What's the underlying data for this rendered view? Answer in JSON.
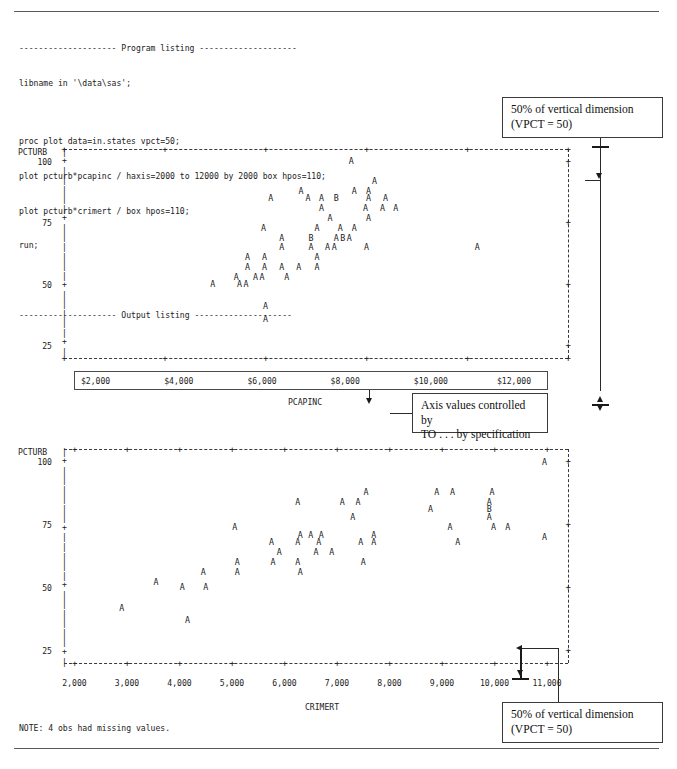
{
  "document": {
    "program_listing_header": "-------------------- Program listing --------------------",
    "output_listing_header": "-------------------- Output listing --------------------",
    "code_lines": [
      "libname in '\\data\\sas';",
      "",
      "proc plot data=in.states vpct=50;",
      "plot pcturb*pcapinc / haxis=2000 to 12000 by 2000 box hpos=110;",
      "plot pcturb*crimert / box hpos=110;",
      "run;"
    ],
    "note": "NOTE: 4 obs had missing values."
  },
  "annotations": [
    {
      "id": "top-right",
      "line1": "50% of vertical dimension",
      "line2": "(VPCT = 50)"
    },
    {
      "id": "middle",
      "line1": "Axis values controlled by",
      "line2": "TO . . . by specification"
    },
    {
      "id": "bottom-right",
      "line1": "50% of vertical dimension",
      "line2": "(VPCT = 50)"
    }
  ],
  "chart_data": [
    {
      "id": "plot-pcapinc",
      "type": "scatter",
      "title": "",
      "xlabel": "PCAPINC",
      "ylabel": "PCTURB",
      "xticklabels": [
        "$2,000",
        "$4,000",
        "$6,000",
        "$8,000",
        "$10,000",
        "$12,000"
      ],
      "xticks": [
        2000,
        4000,
        6000,
        8000,
        10000,
        12000
      ],
      "yticklabels": [
        "100",
        "75",
        "50",
        "25"
      ],
      "yticks": [
        100,
        75,
        50,
        25
      ],
      "xlim": [
        2000,
        12000
      ],
      "ylim": [
        20,
        105
      ],
      "grid": false,
      "box": true,
      "plot_symbol": "A",
      "overlap_symbol": "B",
      "points": [
        {
          "x": 7700,
          "y": 100,
          "s": "A"
        },
        {
          "x": 8160,
          "y": 92,
          "s": "A"
        },
        {
          "x": 6700,
          "y": 88,
          "s": "A"
        },
        {
          "x": 7760,
          "y": 88,
          "s": "A"
        },
        {
          "x": 8040,
          "y": 88,
          "s": "A"
        },
        {
          "x": 6100,
          "y": 85,
          "s": "A"
        },
        {
          "x": 6840,
          "y": 85,
          "s": "A"
        },
        {
          "x": 7110,
          "y": 85,
          "s": "A"
        },
        {
          "x": 7400,
          "y": 85,
          "s": "B"
        },
        {
          "x": 8040,
          "y": 85,
          "s": "A"
        },
        {
          "x": 8380,
          "y": 85,
          "s": "A"
        },
        {
          "x": 7110,
          "y": 81,
          "s": "A"
        },
        {
          "x": 7980,
          "y": 81,
          "s": "A"
        },
        {
          "x": 8320,
          "y": 81,
          "s": "A"
        },
        {
          "x": 8580,
          "y": 81,
          "s": "A"
        },
        {
          "x": 7280,
          "y": 77,
          "s": "A"
        },
        {
          "x": 8040,
          "y": 77,
          "s": "A"
        },
        {
          "x": 5960,
          "y": 73,
          "s": "A"
        },
        {
          "x": 7020,
          "y": 73,
          "s": "A"
        },
        {
          "x": 7480,
          "y": 73,
          "s": "A"
        },
        {
          "x": 7760,
          "y": 73,
          "s": "A"
        },
        {
          "x": 6320,
          "y": 69,
          "s": "A"
        },
        {
          "x": 6900,
          "y": 69,
          "s": "B"
        },
        {
          "x": 7400,
          "y": 69,
          "s": "A"
        },
        {
          "x": 7530,
          "y": 69,
          "s": "B"
        },
        {
          "x": 7660,
          "y": 69,
          "s": "A"
        },
        {
          "x": 6320,
          "y": 65,
          "s": "A"
        },
        {
          "x": 6900,
          "y": 65,
          "s": "A"
        },
        {
          "x": 7230,
          "y": 65,
          "s": "A"
        },
        {
          "x": 7360,
          "y": 65,
          "s": "A"
        },
        {
          "x": 8000,
          "y": 65,
          "s": "A"
        },
        {
          "x": 10200,
          "y": 65,
          "s": "A"
        },
        {
          "x": 5640,
          "y": 61,
          "s": "A"
        },
        {
          "x": 5980,
          "y": 61,
          "s": "A"
        },
        {
          "x": 7020,
          "y": 61,
          "s": "A"
        },
        {
          "x": 5640,
          "y": 57,
          "s": "A"
        },
        {
          "x": 5980,
          "y": 57,
          "s": "A"
        },
        {
          "x": 6320,
          "y": 57,
          "s": "A"
        },
        {
          "x": 6660,
          "y": 57,
          "s": "A"
        },
        {
          "x": 7020,
          "y": 57,
          "s": "A"
        },
        {
          "x": 5420,
          "y": 53,
          "s": "A"
        },
        {
          "x": 5800,
          "y": 53,
          "s": "A"
        },
        {
          "x": 5930,
          "y": 53,
          "s": "A"
        },
        {
          "x": 6420,
          "y": 53,
          "s": "A"
        },
        {
          "x": 4950,
          "y": 50,
          "s": "A"
        },
        {
          "x": 5480,
          "y": 50,
          "s": "A"
        },
        {
          "x": 5610,
          "y": 50,
          "s": "A"
        },
        {
          "x": 6000,
          "y": 41,
          "s": "A"
        },
        {
          "x": 6000,
          "y": 36,
          "s": "A"
        }
      ]
    },
    {
      "id": "plot-crimert",
      "type": "scatter",
      "title": "",
      "xlabel": "CRIMERT",
      "ylabel": "PCTURB",
      "xticklabels": [
        "2,000",
        "3,000",
        "4,000",
        "5,000",
        "6,000",
        "7,000",
        "8,000",
        "9,000",
        "10,000",
        "11,000"
      ],
      "xticks": [
        2000,
        3000,
        4000,
        5000,
        6000,
        7000,
        8000,
        9000,
        10000,
        11000
      ],
      "yticklabels": [
        "100",
        "75",
        "50",
        "25"
      ],
      "yticks": [
        100,
        75,
        50,
        25
      ],
      "xlim": [
        1800,
        11400
      ],
      "ylim": [
        20,
        105
      ],
      "grid": false,
      "box": true,
      "plot_symbol": "A",
      "overlap_symbol": "B",
      "points": [
        {
          "x": 10950,
          "y": 100,
          "s": "A"
        },
        {
          "x": 7550,
          "y": 88,
          "s": "A"
        },
        {
          "x": 8900,
          "y": 88,
          "s": "A"
        },
        {
          "x": 9200,
          "y": 88,
          "s": "A"
        },
        {
          "x": 9950,
          "y": 88,
          "s": "A"
        },
        {
          "x": 6250,
          "y": 84,
          "s": "A"
        },
        {
          "x": 7100,
          "y": 84,
          "s": "A"
        },
        {
          "x": 7400,
          "y": 84,
          "s": "A"
        },
        {
          "x": 9900,
          "y": 84,
          "s": "A"
        },
        {
          "x": 8780,
          "y": 81,
          "s": "A"
        },
        {
          "x": 9900,
          "y": 81,
          "s": "B"
        },
        {
          "x": 7300,
          "y": 78,
          "s": "A"
        },
        {
          "x": 9900,
          "y": 78,
          "s": "A"
        },
        {
          "x": 5050,
          "y": 74,
          "s": "A"
        },
        {
          "x": 9150,
          "y": 74,
          "s": "A"
        },
        {
          "x": 9980,
          "y": 74,
          "s": "A"
        },
        {
          "x": 10250,
          "y": 74,
          "s": "A"
        },
        {
          "x": 6300,
          "y": 71,
          "s": "A"
        },
        {
          "x": 6500,
          "y": 71,
          "s": "A"
        },
        {
          "x": 6700,
          "y": 71,
          "s": "A"
        },
        {
          "x": 7700,
          "y": 71,
          "s": "A"
        },
        {
          "x": 10950,
          "y": 70,
          "s": "A"
        },
        {
          "x": 5750,
          "y": 68,
          "s": "A"
        },
        {
          "x": 6250,
          "y": 68,
          "s": "A"
        },
        {
          "x": 6650,
          "y": 68,
          "s": "A"
        },
        {
          "x": 7450,
          "y": 68,
          "s": "A"
        },
        {
          "x": 7700,
          "y": 68,
          "s": "A"
        },
        {
          "x": 9300,
          "y": 68,
          "s": "A"
        },
        {
          "x": 5900,
          "y": 64,
          "s": "A"
        },
        {
          "x": 6600,
          "y": 64,
          "s": "A"
        },
        {
          "x": 6900,
          "y": 64,
          "s": "A"
        },
        {
          "x": 5100,
          "y": 60,
          "s": "A"
        },
        {
          "x": 5780,
          "y": 60,
          "s": "A"
        },
        {
          "x": 6250,
          "y": 60,
          "s": "A"
        },
        {
          "x": 7500,
          "y": 60,
          "s": "A"
        },
        {
          "x": 4450,
          "y": 56,
          "s": "A"
        },
        {
          "x": 5100,
          "y": 56,
          "s": "A"
        },
        {
          "x": 6300,
          "y": 56,
          "s": "A"
        },
        {
          "x": 3550,
          "y": 52,
          "s": "A"
        },
        {
          "x": 4050,
          "y": 50,
          "s": "A"
        },
        {
          "x": 4500,
          "y": 50,
          "s": "A"
        },
        {
          "x": 2900,
          "y": 42,
          "s": "A"
        },
        {
          "x": 4150,
          "y": 37,
          "s": "A"
        }
      ]
    }
  ]
}
